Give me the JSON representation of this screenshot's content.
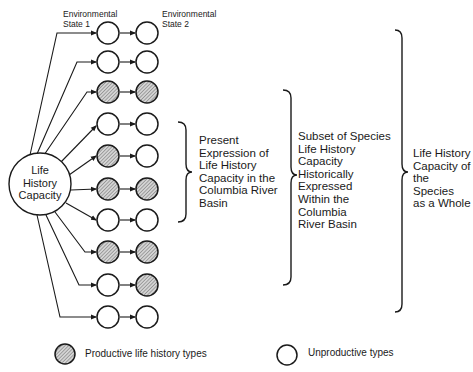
{
  "diagram": {
    "column_headers": {
      "state1": "Environmental State 1",
      "state1_lines": [
        "Environmental",
        "State 1"
      ],
      "state2": "Environmental State 2",
      "state2_lines": [
        "Environmental",
        "State 2"
      ]
    },
    "center_node": {
      "label": "Life History Capacity",
      "lines": [
        "Life",
        "History",
        "Capacity"
      ]
    },
    "rows": [
      {
        "state1": "unproductive",
        "state2": "unproductive"
      },
      {
        "state1": "unproductive",
        "state2": "unproductive"
      },
      {
        "state1": "productive",
        "state2": "productive"
      },
      {
        "state1": "unproductive",
        "state2": "unproductive"
      },
      {
        "state1": "productive",
        "state2": "unproductive"
      },
      {
        "state1": "productive",
        "state2": "productive"
      },
      {
        "state1": "unproductive",
        "state2": "unproductive"
      },
      {
        "state1": "productive",
        "state2": "productive"
      },
      {
        "state1": "unproductive",
        "state2": "productive"
      },
      {
        "state1": "unproductive",
        "state2": "unproductive"
      }
    ],
    "brackets": [
      {
        "label": "Present Expression of Life History Capacity in the Columbia River Basin",
        "lines": [
          "Present",
          "Expression of",
          "Life History",
          "Capacity in the",
          "Columbia River",
          "Basin"
        ]
      },
      {
        "label": "Subset of Species Life History Capacity Historically Expressed Within the Columbia River Basin",
        "lines": [
          "Subset of Species",
          "Life History",
          "Capacity",
          "Historically",
          "Expressed",
          "Within the",
          "Columbia",
          "River Basin"
        ]
      },
      {
        "label": "Life History Capacity of the Species as a Whole",
        "lines": [
          "Life History",
          "Capacity of",
          "the Species",
          "as a Whole"
        ]
      }
    ],
    "legend": {
      "productive": "Productive life history types",
      "unproductive": "Unproductive types"
    },
    "colors": {
      "stroke": "#1a1a1a",
      "productive_fill": "#b8b8b8",
      "unproductive_fill": "#ffffff"
    }
  }
}
